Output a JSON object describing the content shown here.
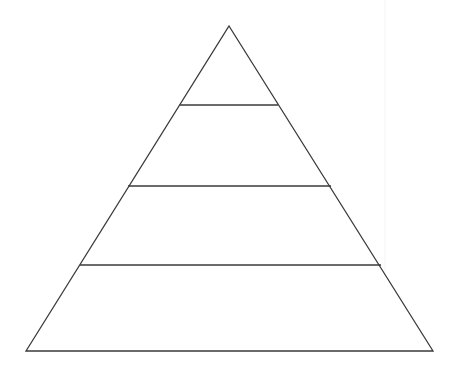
{
  "page": {
    "background_color": "#ffffff",
    "width": 455,
    "height": 368
  },
  "diagram": {
    "type": "pyramid",
    "name": "blank-pyramid-diagram",
    "title": "",
    "level_count": 4,
    "filled": false,
    "stroke_color": "#3a3a3a",
    "fill_color": "#ffffff",
    "stroke_width": 1.3,
    "apex": {
      "x": 229,
      "y": 26
    },
    "base_left": {
      "x": 26,
      "y": 351
    },
    "base_right": {
      "x": 433,
      "y": 351
    },
    "outline_points": "229,26 433,351 26,351",
    "dividers": [
      {
        "name": "divider-1",
        "y": 105,
        "x1": 180,
        "x2": 278,
        "line": "180,105 278,105"
      },
      {
        "name": "divider-2",
        "y": 186,
        "x1": 128,
        "x2": 331,
        "line": "128,186 331,186"
      },
      {
        "name": "divider-3",
        "y": 265,
        "x1": 80,
        "x2": 381,
        "line": "80,265 381,265"
      }
    ],
    "levels": [
      {
        "index": 1,
        "name": "level-1-apex",
        "label": "",
        "top_y": 26,
        "bottom_y": 105,
        "top_width": 0,
        "bottom_width": 98
      },
      {
        "index": 2,
        "name": "level-2",
        "label": "",
        "top_y": 105,
        "bottom_y": 186,
        "top_width": 98,
        "bottom_width": 203
      },
      {
        "index": 3,
        "name": "level-3",
        "label": "",
        "top_y": 186,
        "bottom_y": 265,
        "top_width": 203,
        "bottom_width": 301
      },
      {
        "index": 4,
        "name": "level-4-base",
        "label": "",
        "top_y": 265,
        "bottom_y": 351,
        "top_width": 301,
        "bottom_width": 407
      }
    ],
    "artifact": {
      "name": "scan-seam",
      "visible": true,
      "color": "#f4f4f6",
      "x": 385,
      "y1": 0,
      "y2": 330
    }
  },
  "chart_data": {
    "type": "pyramid",
    "title": "",
    "subtitle": "",
    "xlabel": "",
    "ylabel": "",
    "legend": [],
    "annotations": [],
    "grid": false,
    "categories": [
      "Level 1",
      "Level 2",
      "Level 3",
      "Level 4"
    ],
    "values": [
      null,
      null,
      null,
      null
    ],
    "labels": [
      "",
      "",
      "",
      ""
    ]
  }
}
